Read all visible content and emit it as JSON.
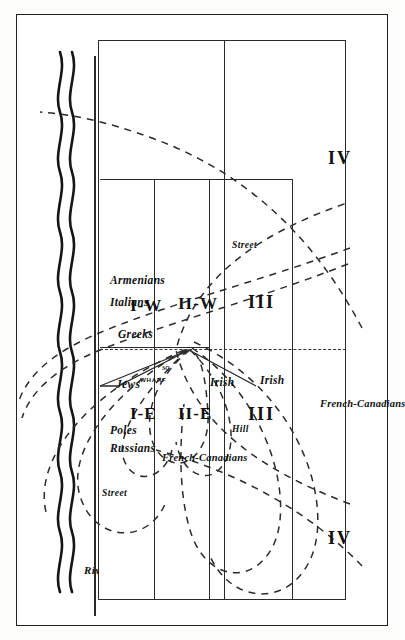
{
  "figure": {
    "type": "zone-diagram",
    "orientation": "rotated-90-ccw"
  },
  "geography": {
    "river_label": "River",
    "street_label_west": "Street",
    "street_label_east": "Street",
    "hill_label": "Hill",
    "wharf_square_name": "WHARF",
    "wharf_square_abbrev": "SQ."
  },
  "zones": [
    {
      "id": "I-W",
      "label": "I-W"
    },
    {
      "id": "I-E",
      "label": "I-E"
    },
    {
      "id": "II-W",
      "label": "II-W"
    },
    {
      "id": "II-E",
      "label": "II-E"
    },
    {
      "id": "III-W",
      "label": "III"
    },
    {
      "id": "III-E",
      "label": "III"
    },
    {
      "id": "IV-W",
      "label": "IV"
    },
    {
      "id": "IV-E",
      "label": "IV"
    }
  ],
  "ethnic_groups": [
    {
      "name": "Armenians",
      "zone": "I-W outer"
    },
    {
      "name": "Italians",
      "zone": "I-W outer"
    },
    {
      "name": "Greeks",
      "zone": "I-W inner"
    },
    {
      "name": "Jews",
      "zone": "I-E inner"
    },
    {
      "name": "Poles",
      "zone": "I-E outer"
    },
    {
      "name": "Russians",
      "zone": "I-E outer"
    },
    {
      "name": "French-Canadians",
      "zone": "II-E"
    },
    {
      "name": "Irish",
      "zone": "II / III boundary"
    },
    {
      "name": "Irish",
      "zone": "III east"
    },
    {
      "name": "French-Canadians",
      "zone": "IV east"
    }
  ],
  "colors": {
    "ink": "#2a2a2a",
    "paper": "#ffffff",
    "frame": "#222222"
  }
}
